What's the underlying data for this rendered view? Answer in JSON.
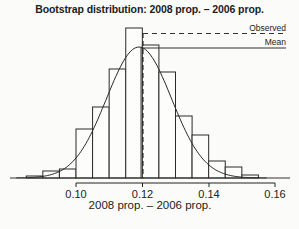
{
  "chart_data": {
    "type": "bar",
    "title": "Bootstrap distribution: 2008 prop. – 2006 prop.",
    "xlabel": "2008 prop. – 2006 prop.",
    "ylabel": "",
    "xlim": [
      0.085,
      0.16
    ],
    "xticks": [
      "0.10",
      "0.12",
      "0.14",
      "0.16"
    ],
    "bin_width": 0.005,
    "bins": [
      0.085,
      0.09,
      0.095,
      0.1,
      0.105,
      0.11,
      0.115,
      0.12,
      0.125,
      0.13,
      0.135,
      0.14,
      0.145,
      0.15
    ],
    "values": [
      2,
      7,
      9,
      49,
      71,
      109,
      150,
      133,
      106,
      62,
      43,
      17,
      11,
      3
    ],
    "value_units": "relative height (px, no y-axis shown)",
    "overlay": {
      "type": "normal-curve",
      "mean": 0.119,
      "sd": 0.0098
    },
    "reference_lines": [
      {
        "name": "Observed",
        "x": 0.12,
        "style": "dashed"
      },
      {
        "name": "Mean",
        "x": 0.119,
        "style": "solid"
      }
    ],
    "legend": [
      "Observed",
      "Mean"
    ],
    "legend_position": "top-right",
    "grid": false
  },
  "header": {
    "title": "Bootstrap distribution: 2008 prop. – 2006 prop."
  },
  "axis": {
    "xlabel": "2008 prop. – 2006 prop.",
    "ticks": [
      "0.10",
      "0.12",
      "0.14",
      "0.16"
    ]
  },
  "legend": {
    "observed": "Observed",
    "mean": "Mean"
  }
}
